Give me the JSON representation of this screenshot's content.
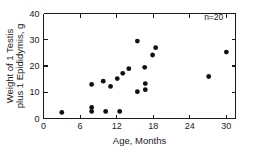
{
  "chart_data": {
    "type": "scatter",
    "title": "",
    "xlabel": "Age, Months",
    "ylabel": "Weight of 1 Testis plus 1 Epididymis, g",
    "ylabel_line1": "Weight of 1 Testis",
    "ylabel_line2": "plus 1 Epididymis, g",
    "xlim": [
      0,
      31.5
    ],
    "ylim": [
      0,
      40
    ],
    "xticks": [
      0,
      6,
      12,
      18,
      24,
      30
    ],
    "xtick_labels": [
      "0",
      "6",
      "12",
      "18",
      "24",
      "30"
    ],
    "yticks": [
      0,
      10,
      20,
      30,
      40
    ],
    "ytick_labels": [
      "0",
      "10",
      "20",
      "30",
      "40"
    ],
    "grid": false,
    "legend": null,
    "annotations": [
      {
        "text": "n=20",
        "x": 29.5,
        "y": 37.5,
        "anchor": "end"
      }
    ],
    "marker": "filled-circle",
    "marker_size": 2.4,
    "marker_color": "#111111",
    "n": 20,
    "points": [
      {
        "x": 3.0,
        "y": 2.3
      },
      {
        "x": 7.9,
        "y": 13.0
      },
      {
        "x": 7.9,
        "y": 4.2
      },
      {
        "x": 7.9,
        "y": 2.7
      },
      {
        "x": 9.8,
        "y": 14.2
      },
      {
        "x": 10.2,
        "y": 2.7
      },
      {
        "x": 11.0,
        "y": 12.2
      },
      {
        "x": 12.1,
        "y": 15.2
      },
      {
        "x": 12.5,
        "y": 2.7
      },
      {
        "x": 13.0,
        "y": 17.2
      },
      {
        "x": 14.0,
        "y": 19.0
      },
      {
        "x": 15.4,
        "y": 29.5
      },
      {
        "x": 15.4,
        "y": 10.2
      },
      {
        "x": 16.6,
        "y": 19.5
      },
      {
        "x": 16.7,
        "y": 13.3
      },
      {
        "x": 16.7,
        "y": 11.0
      },
      {
        "x": 17.9,
        "y": 24.2
      },
      {
        "x": 18.4,
        "y": 27.0
      },
      {
        "x": 27.1,
        "y": 16.0
      },
      {
        "x": 30.0,
        "y": 25.3
      }
    ]
  }
}
